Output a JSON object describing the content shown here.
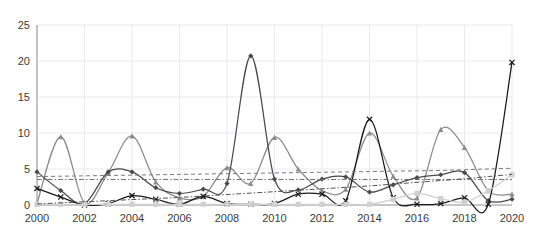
{
  "chart_data": {
    "type": "line",
    "title": "",
    "subtitle": "",
    "xlabel": "",
    "ylabel": "",
    "xlim": [
      2000,
      2020
    ],
    "ylim": [
      0,
      25
    ],
    "grid": true,
    "legend": "none",
    "x_ticks": [
      "2000",
      "2002",
      "2004",
      "2006",
      "2008",
      "2010",
      "2012",
      "2014",
      "2016",
      "2018",
      "2020"
    ],
    "y_ticks": [
      "0",
      "5",
      "10",
      "15",
      "20",
      "25"
    ],
    "x": [
      2000,
      2001,
      2002,
      2003,
      2004,
      2005,
      2006,
      2007,
      2008,
      2009,
      2010,
      2011,
      2012,
      2013,
      2014,
      2015,
      2016,
      2017,
      2018,
      2019,
      2020
    ],
    "series": [
      {
        "name": "series-a-triangles-gray",
        "color": "#8c8c8c",
        "marker": "triangle",
        "dash": "none",
        "values": [
          0.2,
          9.5,
          0.3,
          4.5,
          9.6,
          3.2,
          1.0,
          1.2,
          5.2,
          3.0,
          9.4,
          5.0,
          2.0,
          2.2,
          10.0,
          4.0,
          1.0,
          10.5,
          8.0,
          2.0,
          1.5
        ]
      },
      {
        "name": "series-b-diamonds-dark",
        "color": "#4a4a4a",
        "marker": "diamond",
        "dash": "none",
        "values": [
          4.6,
          2.0,
          0.2,
          4.6,
          4.6,
          2.4,
          1.6,
          2.2,
          3.0,
          20.7,
          3.6,
          2.1,
          3.6,
          3.9,
          1.8,
          2.8,
          3.8,
          4.2,
          4.5,
          0.6,
          0.8
        ]
      },
      {
        "name": "series-c-crosses-black",
        "color": "#1a1a1a",
        "marker": "cross",
        "dash": "none",
        "values": [
          2.3,
          1.1,
          0.0,
          0.2,
          1.3,
          0.8,
          0.1,
          1.2,
          0.2,
          0.1,
          0.2,
          1.5,
          1.5,
          0.6,
          11.9,
          1.0,
          0.1,
          0.2,
          1.0,
          0.1,
          19.8
        ]
      },
      {
        "name": "series-d-squares-light",
        "color": "#d0d0d0",
        "marker": "square",
        "dash": "none",
        "values": [
          0.1,
          0.1,
          0.1,
          0.1,
          0.1,
          0.1,
          0.1,
          0.1,
          0.1,
          0.1,
          0.1,
          0.1,
          0.1,
          0.1,
          0.1,
          0.8,
          1.6,
          0.9,
          0.4,
          2.0,
          4.2
        ]
      },
      {
        "name": "trendline-upper-dashed",
        "color": "#7a7a7a",
        "marker": "none",
        "dash": "dashed",
        "values": [
          3.95,
          4.0,
          4.05,
          4.1,
          4.15,
          4.2,
          4.25,
          4.3,
          4.35,
          4.4,
          4.45,
          4.5,
          4.55,
          4.6,
          4.65,
          4.7,
          4.75,
          4.8,
          4.9,
          5.0,
          5.1
        ]
      },
      {
        "name": "trendline-lower-dashed",
        "color": "#6f6f6f",
        "marker": "none",
        "dash": "dashdot",
        "values": [
          3.55,
          3.55,
          3.55,
          3.55,
          3.55,
          3.55,
          3.55,
          3.55,
          3.55,
          3.55,
          3.55,
          3.55,
          3.55,
          3.55,
          3.55,
          3.55,
          3.55,
          3.55,
          3.55,
          3.55,
          3.55
        ]
      },
      {
        "name": "trendline-rising-dashed",
        "color": "#555555",
        "marker": "none",
        "dash": "dashdot",
        "values": [
          0.15,
          0.3,
          0.45,
          0.6,
          0.75,
          0.9,
          1.05,
          1.25,
          1.45,
          1.65,
          1.85,
          2.05,
          2.25,
          2.45,
          2.65,
          2.9,
          3.15,
          3.4,
          3.65,
          3.95,
          4.25
        ]
      }
    ]
  },
  "axis": {
    "y_label_0": "0",
    "y_label_5": "5",
    "y_label_10": "10",
    "y_label_15": "15",
    "y_label_20": "20",
    "y_label_25": "25"
  }
}
